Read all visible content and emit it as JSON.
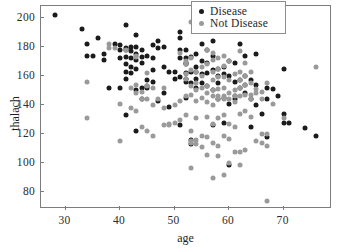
{
  "chart_data": {
    "type": "scatter",
    "title": "",
    "xlabel": "age",
    "ylabel": "thalach",
    "xlim": [
      25.5,
      78.5
    ],
    "ylim": [
      70,
      208
    ],
    "xticks": [
      30,
      40,
      50,
      60,
      70
    ],
    "yticks": [
      80,
      100,
      120,
      140,
      160,
      180,
      200
    ],
    "grid": false,
    "legend_position": "top-right",
    "colors": {
      "disease": "#1b1b1b",
      "not_disease": "#9a9a9a",
      "axis": "#7d7d7d",
      "background": "#ffffff",
      "text": "#1e1e1e"
    },
    "series": [
      {
        "name": "Disease",
        "color": "#1b1b1b",
        "points": [
          [
            28,
            202
          ],
          [
            33,
            192
          ],
          [
            34,
            182
          ],
          [
            34,
            174
          ],
          [
            35,
            174
          ],
          [
            36,
            186
          ],
          [
            37,
            175
          ],
          [
            37,
            171
          ],
          [
            38,
            152
          ],
          [
            39,
            182
          ],
          [
            40,
            181
          ],
          [
            40,
            178
          ],
          [
            40,
            172
          ],
          [
            40,
            152
          ],
          [
            41,
            195
          ],
          [
            41,
            179
          ],
          [
            41,
            178
          ],
          [
            41,
            173
          ],
          [
            41,
            168
          ],
          [
            41,
            163
          ],
          [
            41,
            158
          ],
          [
            41,
            133
          ],
          [
            42,
            180
          ],
          [
            42,
            177
          ],
          [
            42,
            172
          ],
          [
            42,
            166
          ],
          [
            42,
            162
          ],
          [
            43,
            188
          ],
          [
            43,
            180
          ],
          [
            43,
            175
          ],
          [
            43,
            171
          ],
          [
            43,
            165
          ],
          [
            43,
            150
          ],
          [
            43,
            122
          ],
          [
            44,
            178
          ],
          [
            44,
            173
          ],
          [
            44,
            169
          ],
          [
            44,
            152
          ],
          [
            44,
            144
          ],
          [
            45,
            174
          ],
          [
            45,
            157
          ],
          [
            45,
            153
          ],
          [
            45,
            152
          ],
          [
            46,
            181
          ],
          [
            46,
            172
          ],
          [
            46,
            164
          ],
          [
            46,
            156
          ],
          [
            47,
            184
          ],
          [
            47,
            179
          ],
          [
            47,
            143
          ],
          [
            48,
            180
          ],
          [
            48,
            166
          ],
          [
            48,
            148
          ],
          [
            49,
            163
          ],
          [
            49,
            139
          ],
          [
            50,
            163
          ],
          [
            50,
            158
          ],
          [
            51,
            190
          ],
          [
            51,
            186
          ],
          [
            51,
            178
          ],
          [
            51,
            172
          ],
          [
            51,
            159
          ],
          [
            51,
            126
          ],
          [
            52,
            178
          ],
          [
            52,
            172
          ],
          [
            52,
            169
          ],
          [
            52,
            168
          ],
          [
            52,
            162
          ],
          [
            52,
            158
          ],
          [
            52,
            156
          ],
          [
            52,
            145
          ],
          [
            53,
            173
          ],
          [
            53,
            163
          ],
          [
            53,
            155
          ],
          [
            53,
            116
          ],
          [
            53,
            113
          ],
          [
            54,
            175
          ],
          [
            54,
            166
          ],
          [
            54,
            163
          ],
          [
            54,
            158
          ],
          [
            54,
            152
          ],
          [
            55,
            182
          ],
          [
            55,
            170
          ],
          [
            55,
            161
          ],
          [
            55,
            155
          ],
          [
            56,
            178
          ],
          [
            56,
            169
          ],
          [
            56,
            162
          ],
          [
            56,
            153
          ],
          [
            57,
            184
          ],
          [
            57,
            174
          ],
          [
            57,
            164
          ],
          [
            57,
            150
          ],
          [
            57,
            126
          ],
          [
            58,
            165
          ],
          [
            58,
            160
          ],
          [
            58,
            155
          ],
          [
            58,
            144
          ],
          [
            59,
            166
          ],
          [
            59,
            161
          ],
          [
            59,
            145
          ],
          [
            59,
            128
          ],
          [
            60,
            170
          ],
          [
            60,
            160
          ],
          [
            60,
            141
          ],
          [
            60,
            99
          ],
          [
            61,
            169
          ],
          [
            61,
            156
          ],
          [
            61,
            146
          ],
          [
            61,
            144
          ],
          [
            62,
            182
          ],
          [
            62,
            157
          ],
          [
            62,
            152
          ],
          [
            63,
            174
          ],
          [
            63,
            160
          ],
          [
            63,
            154
          ],
          [
            63,
            148
          ],
          [
            64,
            157
          ],
          [
            64,
            144
          ],
          [
            64,
            125
          ],
          [
            65,
            175
          ],
          [
            65,
            154
          ],
          [
            65,
            140
          ],
          [
            66,
            134
          ],
          [
            67,
            152
          ],
          [
            67,
            144
          ],
          [
            67,
            118
          ],
          [
            68,
            151
          ],
          [
            69,
            146
          ],
          [
            70,
            165
          ],
          [
            70,
            134
          ],
          [
            70,
            128
          ],
          [
            71,
            128
          ],
          [
            74,
            124
          ],
          [
            76,
            119
          ]
        ]
      },
      {
        "name": "Not Disease",
        "color": "#9a9a9a",
        "points": [
          [
            34,
            156
          ],
          [
            34,
            131
          ],
          [
            38,
            182
          ],
          [
            38,
            179
          ],
          [
            39,
            179
          ],
          [
            40,
            141
          ],
          [
            40,
            115
          ],
          [
            41,
            178
          ],
          [
            42,
            152
          ],
          [
            42,
            138
          ],
          [
            43,
            174
          ],
          [
            43,
            173
          ],
          [
            43,
            154
          ],
          [
            43,
            148
          ],
          [
            43,
            136
          ],
          [
            44,
            149
          ],
          [
            44,
            144
          ],
          [
            44,
            125
          ],
          [
            45,
            162
          ],
          [
            45,
            153
          ],
          [
            45,
            144
          ],
          [
            45,
            122
          ],
          [
            46,
            152
          ],
          [
            46,
            140
          ],
          [
            46,
            119
          ],
          [
            47,
            144
          ],
          [
            48,
            152
          ],
          [
            48,
            138
          ],
          [
            48,
            126
          ],
          [
            49,
            127
          ],
          [
            49,
            126
          ],
          [
            50,
            140
          ],
          [
            50,
            128
          ],
          [
            51,
            176
          ],
          [
            51,
            143
          ],
          [
            51,
            130
          ],
          [
            52,
            170
          ],
          [
            52,
            168
          ],
          [
            52,
            161
          ],
          [
            52,
            158
          ],
          [
            52,
            146
          ],
          [
            52,
            133
          ],
          [
            53,
            197
          ],
          [
            53,
            172
          ],
          [
            53,
            164
          ],
          [
            53,
            153
          ],
          [
            53,
            147
          ],
          [
            53,
            122
          ],
          [
            53,
            115
          ],
          [
            53,
            114
          ],
          [
            53,
            97
          ],
          [
            54,
            163
          ],
          [
            54,
            155
          ],
          [
            54,
            150
          ],
          [
            54,
            143
          ],
          [
            54,
            131
          ],
          [
            54,
            116
          ],
          [
            54,
            113
          ],
          [
            55,
            166
          ],
          [
            55,
            160
          ],
          [
            55,
            152
          ],
          [
            55,
            145
          ],
          [
            55,
            119
          ],
          [
            55,
            111
          ],
          [
            56,
            178
          ],
          [
            56,
            168
          ],
          [
            56,
            153
          ],
          [
            56,
            148
          ],
          [
            56,
            142
          ],
          [
            56,
            132
          ],
          [
            56,
            118
          ],
          [
            56,
            106
          ],
          [
            57,
            176
          ],
          [
            57,
            171
          ],
          [
            57,
            163
          ],
          [
            57,
            157
          ],
          [
            57,
            150
          ],
          [
            57,
            146
          ],
          [
            57,
            140
          ],
          [
            57,
            127
          ],
          [
            57,
            114
          ],
          [
            57,
            90
          ],
          [
            58,
            172
          ],
          [
            58,
            165
          ],
          [
            58,
            159
          ],
          [
            58,
            151
          ],
          [
            58,
            146
          ],
          [
            58,
            144
          ],
          [
            58,
            131
          ],
          [
            58,
            112
          ],
          [
            58,
            105
          ],
          [
            59,
            174
          ],
          [
            59,
            167
          ],
          [
            59,
            159
          ],
          [
            59,
            152
          ],
          [
            59,
            146
          ],
          [
            59,
            144
          ],
          [
            59,
            133
          ],
          [
            59,
            119
          ],
          [
            59,
            92
          ],
          [
            60,
            170
          ],
          [
            60,
            157
          ],
          [
            60,
            148
          ],
          [
            60,
            144
          ],
          [
            60,
            127
          ],
          [
            60,
            117
          ],
          [
            60,
            100
          ],
          [
            61,
            161
          ],
          [
            61,
            150
          ],
          [
            61,
            146
          ],
          [
            61,
            142
          ],
          [
            61,
            125
          ],
          [
            61,
            108
          ],
          [
            62,
            177
          ],
          [
            62,
            163
          ],
          [
            62,
            157
          ],
          [
            62,
            152
          ],
          [
            62,
            146
          ],
          [
            62,
            134
          ],
          [
            62,
            108
          ],
          [
            62,
            99
          ],
          [
            63,
            169
          ],
          [
            63,
            160
          ],
          [
            63,
            154
          ],
          [
            63,
            147
          ],
          [
            63,
            136
          ],
          [
            63,
            109
          ],
          [
            64,
            163
          ],
          [
            64,
            155
          ],
          [
            64,
            147
          ],
          [
            64,
            144
          ],
          [
            64,
            132
          ],
          [
            65,
            151
          ],
          [
            65,
            148
          ],
          [
            65,
            115
          ],
          [
            66,
            149
          ],
          [
            66,
            144
          ],
          [
            66,
            120
          ],
          [
            66,
            114
          ],
          [
            67,
            155
          ],
          [
            67,
            120
          ],
          [
            67,
            112
          ],
          [
            67,
            74
          ],
          [
            68,
            141
          ],
          [
            70,
            131
          ],
          [
            76,
            166
          ]
        ]
      }
    ],
    "legend": [
      {
        "label": "Disease",
        "color": "#1b1b1b",
        "marker": "circle"
      },
      {
        "label": "Not Disease",
        "color": "#9a9a9a",
        "marker": "circle"
      }
    ]
  },
  "axis_titles": {
    "x": "age",
    "y": "thalach"
  }
}
